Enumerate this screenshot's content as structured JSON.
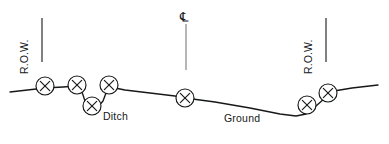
{
  "diagram": {
    "type": "engineering-cross-section",
    "title_visible": false,
    "labels": {
      "row_left": "R.O.W.",
      "row_right": "R.O.W.",
      "ditch": "Ditch",
      "ground": "Ground",
      "centerline_symbol": "℄"
    },
    "colors": {
      "ink": "#16181a",
      "centerline": "#5a5d60",
      "background": "#ffffff"
    },
    "ground_profile": "M 10 92 L 45 88 L 63 87 L 77 86 L 82 92 L 85 101 L 90 108 L 97 108 L 103 101 L 106 93 L 110 87 L 125 90 L 150 93 L 175 96 L 185 98 L 215 102 L 250 108 L 280 114 L 296 116 L 306 114 L 316 106 L 325 98 L 334 91 L 352 88 L 378 85",
    "row_lines": [
      {
        "name": "row-left-rule",
        "x": 42,
        "y1": 18,
        "y2": 62
      },
      {
        "name": "row-right-rule",
        "x": 326,
        "y1": 18,
        "y2": 62
      }
    ],
    "center_line": {
      "name": "centerline-rule",
      "x": 186,
      "y1": 24,
      "y2": 70
    },
    "markers": [
      {
        "id": "marker-1",
        "cx": 45,
        "cy": 86,
        "r": 9
      },
      {
        "id": "marker-2",
        "cx": 77,
        "cy": 85,
        "r": 9
      },
      {
        "id": "marker-3",
        "cx": 92,
        "cy": 106,
        "r": 9
      },
      {
        "id": "marker-4",
        "cx": 109,
        "cy": 85,
        "r": 9
      },
      {
        "id": "marker-5",
        "cx": 185,
        "cy": 98,
        "r": 9
      },
      {
        "id": "marker-6",
        "cx": 307,
        "cy": 105,
        "r": 9
      },
      {
        "id": "marker-7",
        "cx": 328,
        "cy": 93,
        "r": 9
      }
    ],
    "marker_glyph": "X",
    "label_positions": {
      "row_left": {
        "left": 30,
        "top": 62
      },
      "row_right": {
        "left": 314,
        "top": 62
      },
      "ditch": {
        "left": 103,
        "top": 110
      },
      "ground": {
        "left": 224,
        "top": 112
      },
      "centerline_symbol": {
        "left": 180,
        "top": 10
      }
    }
  }
}
